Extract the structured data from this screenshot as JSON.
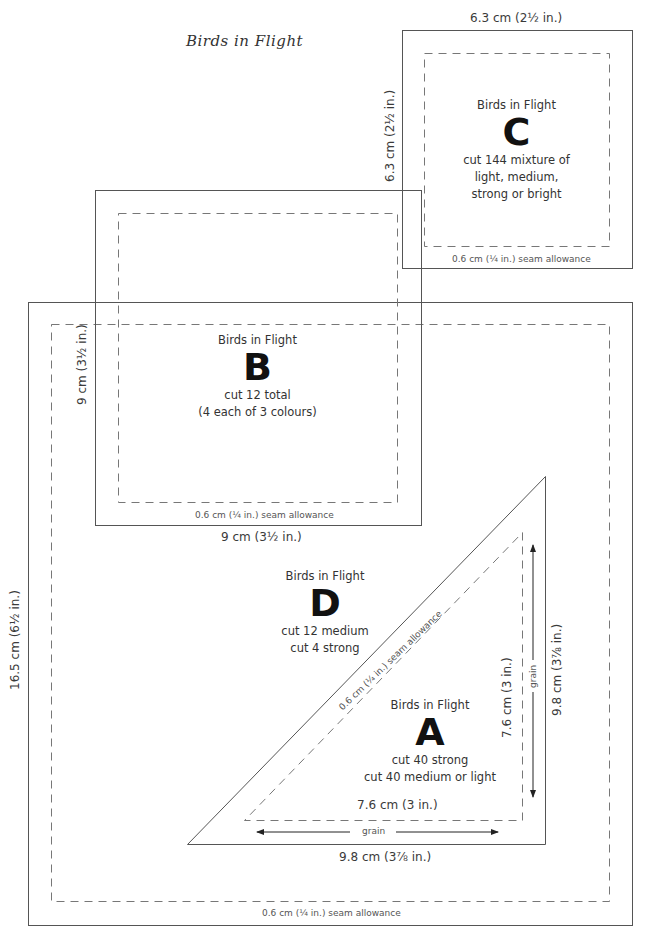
{
  "title": "Birds in Flight",
  "colors": {
    "line": "#555555",
    "dashed": "#777777",
    "text": "#333333",
    "letter": "#111111"
  },
  "pieces": {
    "C": {
      "name": "Birds in Flight",
      "letter": "C",
      "lines": [
        "cut 144 mixture of",
        "light, medium,",
        "strong or bright"
      ],
      "width_label": "6.3 cm (2½ in.)",
      "height_label": "6.3 cm (2½ in.)",
      "seam_label": "0.6 cm (¼ in.) seam allowance"
    },
    "B": {
      "name": "Birds in Flight",
      "letter": "B",
      "lines": [
        "cut 12 total",
        "(4 each of 3 colours)"
      ],
      "width_label": "9 cm (3½ in.)",
      "height_label": "9 cm (3½ in.)",
      "seam_label": "0.6 cm (¼ in.) seam allowance"
    },
    "D": {
      "name": "Birds in Flight",
      "letter": "D",
      "lines": [
        "cut 12 medium",
        "cut 4 strong"
      ],
      "height_label": "16.5 cm (6½ in.)",
      "seam_label": "0.6 cm (¼ in.) seam allowance"
    },
    "A": {
      "name": "Birds in Flight",
      "letter": "A",
      "lines": [
        "cut 40 strong",
        "cut 40 medium or light"
      ],
      "inner_width_label": "7.6 cm (3 in.)",
      "inner_height_label": "7.6 cm (3 in.)",
      "outer_width_label": "9.8 cm (3⅞ in.)",
      "outer_height_label": "9.8 cm (3⅞ in.)",
      "seam_label": "0.6 cm (¼ in.) seam allowance",
      "grain_label_h": "grain",
      "grain_label_v": "grain"
    }
  }
}
